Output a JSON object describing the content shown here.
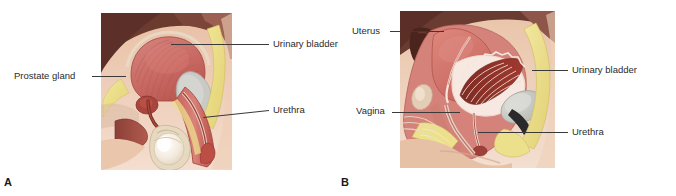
{
  "figure": {
    "text_color": "#2b2b2b",
    "leader_color": "#3a3a3a",
    "background": "#ffffff"
  },
  "panels": [
    {
      "letter": "A",
      "name": "male-sagittal-section",
      "labels": [
        {
          "id": "prostate-gland",
          "text": "Prostate gland"
        },
        {
          "id": "urinary-bladder",
          "text": "Urinary bladder"
        },
        {
          "id": "urethra",
          "text": "Urethra"
        }
      ]
    },
    {
      "letter": "B",
      "name": "female-sagittal-section",
      "labels": [
        {
          "id": "uterus",
          "text": "Uterus"
        },
        {
          "id": "urinary-bladder",
          "text": "Urinary bladder"
        },
        {
          "id": "vagina",
          "text": "Vagina"
        },
        {
          "id": "urethra",
          "text": "Urethra"
        }
      ]
    }
  ],
  "colors": {
    "skin": "#e3b79a",
    "muscle_red": "#c4574f",
    "bladder_pink": "#cf6f6b",
    "fat_yellow": "#ece08a",
    "tissue_mauve": "#b8837c",
    "dark_cavity": "#5a3028",
    "bone_gray": "#c9c9c6",
    "pale_cream": "#f0e6d2",
    "deep_red": "#8f2f28"
  }
}
